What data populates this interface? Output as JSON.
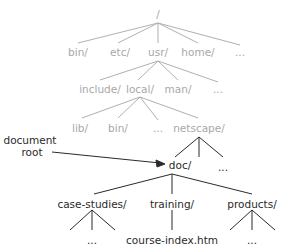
{
  "diagram": {
    "root": {
      "label": "/"
    },
    "level1": [
      {
        "label": "bin/"
      },
      {
        "label": "etc/"
      },
      {
        "label": "usr/"
      },
      {
        "label": "home/"
      },
      {
        "label": "..."
      }
    ],
    "level2": [
      {
        "label": "include/"
      },
      {
        "label": "local/"
      },
      {
        "label": "man/"
      },
      {
        "label": "..."
      }
    ],
    "level3": [
      {
        "label": "lib/"
      },
      {
        "label": "bin/"
      },
      {
        "label": "..."
      },
      {
        "label": "netscape/"
      }
    ],
    "level4": [
      {
        "label": "doc/"
      },
      {
        "label": "..."
      }
    ],
    "annotation": {
      "line1": "document",
      "line2": "root"
    },
    "level5": [
      {
        "label": "case-studies/"
      },
      {
        "label": "training/"
      },
      {
        "label": "products/"
      }
    ],
    "level6": [
      {
        "label": "..."
      },
      {
        "label": "course-index.htm"
      },
      {
        "label": "..."
      }
    ],
    "colors": {
      "faded": "#a8a8a8",
      "active": "#2a2a2a"
    }
  }
}
